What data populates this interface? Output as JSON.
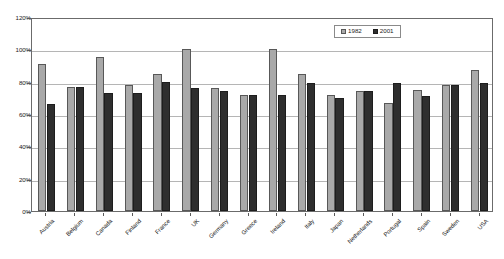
{
  "chart_data": {
    "type": "bar",
    "title": "",
    "subtitle": "",
    "xlabel": "",
    "ylabel": "",
    "ylim": [
      0,
      120
    ],
    "ytick_values": [
      0,
      20,
      40,
      60,
      80,
      100,
      120
    ],
    "ytick_labels": [
      "0%",
      "20%",
      "40%",
      "60%",
      "80%",
      "100%",
      "120%"
    ],
    "grid": true,
    "grid_axis": "y",
    "legend_position": "top-right",
    "categories": [
      "Austria",
      "Belgium",
      "Canada",
      "Finland",
      "France",
      "UK",
      "Germany",
      "Greece",
      "Ireland",
      "Italy",
      "Japan",
      "Netherlands",
      "Portugal",
      "Spain",
      "Sweden",
      "USA"
    ],
    "series": [
      {
        "name": "1982",
        "color": "#a9a9a9",
        "values": [
          91,
          77,
          95,
          78,
          85,
          100,
          76,
          72,
          100,
          85,
          72,
          74,
          67,
          75,
          78,
          87
        ]
      },
      {
        "name": "2001",
        "color": "#2e2e2e",
        "values": [
          66,
          77,
          73,
          73,
          80,
          76,
          74,
          72,
          72,
          79,
          70,
          74,
          79,
          71,
          78,
          79
        ]
      }
    ]
  },
  "legend": {
    "entries": [
      {
        "label": "1982",
        "swatch": "series-1982-swatch"
      },
      {
        "label": "2001",
        "swatch": "series-2001-swatch"
      }
    ]
  }
}
